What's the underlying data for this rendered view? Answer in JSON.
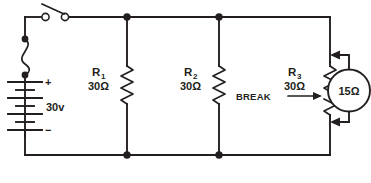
{
  "diagram": {
    "background_color": "#ffffff",
    "line_color": "#231f20"
  },
  "source": {
    "name": "battery",
    "voltage_label": "30v",
    "positive_sign": "+",
    "negative_sign": "−"
  },
  "switch": {
    "name": "spst-switch",
    "state": "open"
  },
  "resistors": [
    {
      "ref": "R",
      "subscript": "1",
      "value": "30Ω"
    },
    {
      "ref": "R",
      "subscript": "2",
      "value": "30Ω"
    },
    {
      "ref": "R",
      "subscript": "3",
      "value": "30Ω"
    }
  ],
  "annotations": {
    "break_label": "BREAK"
  },
  "meter": {
    "name": "ohmmeter",
    "reading": "15Ω"
  }
}
